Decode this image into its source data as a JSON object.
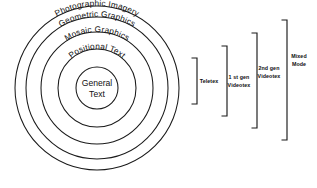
{
  "diagram": {
    "type": "concentric-rings",
    "title": "",
    "background_color": "#ffffff",
    "stroke_color": "#1a1a1a",
    "center": {
      "x": 97,
      "y": 88
    },
    "rings": [
      {
        "index": 0,
        "label": "Photographic Imagery",
        "radius": 82,
        "label_position": "arc-top",
        "level": "outermost"
      },
      {
        "index": 1,
        "label": "Geometric Graphics",
        "radius": 71,
        "label_position": "arc-top",
        "level": "4"
      },
      {
        "index": 2,
        "label": "Mosaic Graphics",
        "radius": 56,
        "label_position": "arc-top",
        "level": "3"
      },
      {
        "index": 3,
        "label": "Positional Text",
        "radius": 39,
        "label_position": "arc-top",
        "level": "2"
      },
      {
        "index": 4,
        "label": "General Text",
        "label_line_1": "General",
        "label_line_2": "Text",
        "radius": 21,
        "label_position": "center",
        "level": "innermost"
      }
    ],
    "brackets": [
      {
        "index": 0,
        "label": "Teletex",
        "label_lines": [
          "Teletex"
        ],
        "x": 196,
        "top": 58,
        "bottom": 104,
        "covers_rings": [
          "General Text"
        ]
      },
      {
        "index": 1,
        "label": "1 st gen Videotex",
        "label_lines": [
          "1 st gen",
          "Videotex"
        ],
        "x": 226,
        "top": 46,
        "bottom": 116,
        "covers_rings": [
          "General Text",
          "Positional Text"
        ]
      },
      {
        "index": 2,
        "label": "2nd gen Videotex",
        "label_lines": [
          "2nd gen",
          "Videotex"
        ],
        "x": 256,
        "top": 33,
        "bottom": 128,
        "covers_rings": [
          "General Text",
          "Positional Text",
          "Mosaic Graphics"
        ]
      },
      {
        "index": 3,
        "label": "Mixed Mode",
        "label_lines": [
          "Mixed",
          "Mode"
        ],
        "x": 286,
        "top": 20,
        "bottom": 140,
        "covers_rings": [
          "General Text",
          "Positional Text",
          "Mosaic Graphics",
          "Geometric Graphics",
          "Photographic Imagery"
        ]
      }
    ]
  }
}
